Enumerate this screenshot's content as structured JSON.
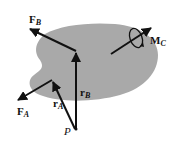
{
  "diagram": {
    "type": "rigid-body force/moment diagram",
    "body_color": "#a9a9a9",
    "arrow_color": "#111111",
    "labels": {
      "force_b": "F",
      "force_b_sub": "B",
      "force_a": "F",
      "force_a_sub": "A",
      "r_a": "r",
      "r_a_sub": "A",
      "r_b": "r",
      "r_b_sub": "B",
      "moment": "M",
      "moment_sub": "C",
      "point": "P"
    }
  }
}
